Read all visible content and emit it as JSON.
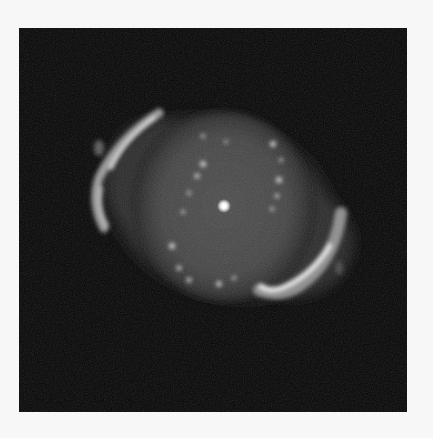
{
  "image": {
    "subject": "planetary nebula",
    "description": "Grayscale astronomical photograph of a planetary nebula with a bright central star, faint inner ring of knots and two bright outer arcs",
    "background_color": "#f7f7f7",
    "frame_color": "#050505",
    "nebula_glow_color": "#4a4a4a",
    "highlight_color": "#f2f2f2"
  }
}
